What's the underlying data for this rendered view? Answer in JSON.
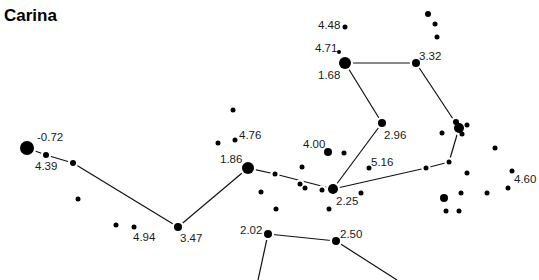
{
  "title": "Carina",
  "colors": {
    "star": "#000000",
    "line": "#111111",
    "label": "#1a1a1a",
    "background": "#ffffff"
  },
  "stars": [
    {
      "id": "s1",
      "x": 27,
      "y": 148,
      "r": 7,
      "label": "-0.72",
      "lx": 37,
      "ly": 141
    },
    {
      "id": "s2",
      "x": 46,
      "y": 155,
      "r": 3,
      "label": "4.39",
      "lx": 35,
      "ly": 170
    },
    {
      "id": "s3",
      "x": 73,
      "y": 163,
      "r": 3
    },
    {
      "id": "s4",
      "x": 78,
      "y": 199,
      "r": 2.5
    },
    {
      "id": "s5",
      "x": 116,
      "y": 225,
      "r": 2.5
    },
    {
      "id": "s6",
      "x": 134,
      "y": 227,
      "r": 2.5,
      "label": "4.94",
      "lx": 133,
      "ly": 241
    },
    {
      "id": "s7",
      "x": 178,
      "y": 227,
      "r": 4,
      "label": "3.47",
      "lx": 180,
      "ly": 242
    },
    {
      "id": "s8",
      "x": 248,
      "y": 168,
      "r": 6,
      "label": "1.86",
      "lx": 220,
      "ly": 163
    },
    {
      "id": "s9",
      "x": 233,
      "y": 110,
      "r": 2.5
    },
    {
      "id": "s10",
      "x": 218,
      "y": 143,
      "r": 2.5
    },
    {
      "id": "s11",
      "x": 235,
      "y": 140,
      "r": 2.5,
      "label": "4.76",
      "lx": 239,
      "ly": 139
    },
    {
      "id": "s12",
      "x": 275,
      "y": 174,
      "r": 2.5
    },
    {
      "id": "s13",
      "x": 261,
      "y": 192,
      "r": 2.5
    },
    {
      "id": "s14",
      "x": 276,
      "y": 209,
      "r": 2.5
    },
    {
      "id": "s15",
      "x": 302,
      "y": 167,
      "r": 2.5
    },
    {
      "id": "s16",
      "x": 300,
      "y": 184,
      "r": 2.5
    },
    {
      "id": "s17",
      "x": 305,
      "y": 188,
      "r": 2.5
    },
    {
      "id": "s18",
      "x": 322,
      "y": 190,
      "r": 2.5
    },
    {
      "id": "s19",
      "x": 328,
      "y": 152,
      "r": 4,
      "label": "4.00",
      "lx": 303,
      "ly": 148
    },
    {
      "id": "s20",
      "x": 344,
      "y": 153,
      "r": 2.5
    },
    {
      "id": "s21",
      "x": 333,
      "y": 189,
      "r": 5,
      "label": "2.25",
      "lx": 336,
      "ly": 205
    },
    {
      "id": "s22",
      "x": 361,
      "y": 193,
      "r": 2.5
    },
    {
      "id": "s23",
      "x": 329,
      "y": 209,
      "r": 2.5
    },
    {
      "id": "s24",
      "x": 369,
      "y": 168,
      "r": 2.5,
      "label": "5.16",
      "lx": 371,
      "ly": 166
    },
    {
      "id": "s25",
      "x": 382,
      "y": 123,
      "r": 4,
      "label": "2.96",
      "lx": 384,
      "ly": 139
    },
    {
      "id": "s26",
      "x": 345,
      "y": 63,
      "r": 6,
      "label": "1.68",
      "lx": 318,
      "ly": 79
    },
    {
      "id": "s27",
      "x": 345,
      "y": 27,
      "r": 2.5,
      "label": "4.48",
      "lx": 318,
      "ly": 29
    },
    {
      "id": "s28",
      "x": 339,
      "y": 52,
      "r": 2,
      "label": "4.71",
      "lx": 315,
      "ly": 52
    },
    {
      "id": "s29",
      "x": 416,
      "y": 63,
      "r": 4,
      "label": "3.32",
      "lx": 419,
      "ly": 60
    },
    {
      "id": "s30",
      "x": 428,
      "y": 14,
      "r": 3
    },
    {
      "id": "s31",
      "x": 435,
      "y": 24,
      "r": 2.5
    },
    {
      "id": "s32",
      "x": 437,
      "y": 37,
      "r": 2.5
    },
    {
      "id": "s33",
      "x": 459,
      "y": 128,
      "r": 5
    },
    {
      "id": "s34",
      "x": 456,
      "y": 122,
      "r": 3
    },
    {
      "id": "s35",
      "x": 467,
      "y": 125,
      "r": 2.5
    },
    {
      "id": "s36",
      "x": 462,
      "y": 134,
      "r": 2.5
    },
    {
      "id": "s37",
      "x": 442,
      "y": 133,
      "r": 2.5
    },
    {
      "id": "s38",
      "x": 449,
      "y": 162,
      "r": 2.5
    },
    {
      "id": "s39",
      "x": 426,
      "y": 168,
      "r": 2.5
    },
    {
      "id": "s40",
      "x": 495,
      "y": 148,
      "r": 2.5
    },
    {
      "id": "s41",
      "x": 467,
      "y": 173,
      "r": 2.5
    },
    {
      "id": "s42",
      "x": 512,
      "y": 171,
      "r": 2.5,
      "label": "4.60",
      "lx": 514,
      "ly": 183
    },
    {
      "id": "s43",
      "x": 508,
      "y": 188,
      "r": 2.5
    },
    {
      "id": "s44",
      "x": 487,
      "y": 193,
      "r": 2.5
    },
    {
      "id": "s45",
      "x": 461,
      "y": 193,
      "r": 2.5
    },
    {
      "id": "s46",
      "x": 444,
      "y": 198,
      "r": 4
    },
    {
      "id": "s47",
      "x": 446,
      "y": 211,
      "r": 2.5
    },
    {
      "id": "s48",
      "x": 459,
      "y": 211,
      "r": 2.5
    },
    {
      "id": "s49",
      "x": 268,
      "y": 234,
      "r": 4,
      "label": "2.02",
      "lx": 240,
      "ly": 234
    },
    {
      "id": "s50",
      "x": 336,
      "y": 241,
      "r": 4,
      "label": "2.50",
      "lx": 340,
      "ly": 238
    }
  ],
  "lines": [
    [
      27,
      148,
      46,
      155
    ],
    [
      46,
      155,
      73,
      163
    ],
    [
      73,
      163,
      178,
      227
    ],
    [
      178,
      227,
      248,
      168
    ],
    [
      248,
      168,
      275,
      174
    ],
    [
      275,
      174,
      333,
      189
    ],
    [
      333,
      189,
      382,
      123
    ],
    [
      382,
      123,
      345,
      63
    ],
    [
      345,
      63,
      416,
      63
    ],
    [
      416,
      63,
      459,
      128
    ],
    [
      459,
      128,
      449,
      162
    ],
    [
      449,
      162,
      426,
      168
    ],
    [
      426,
      168,
      333,
      189
    ],
    [
      268,
      234,
      336,
      241
    ],
    [
      268,
      234,
      258,
      280
    ],
    [
      336,
      241,
      397,
      280
    ]
  ]
}
